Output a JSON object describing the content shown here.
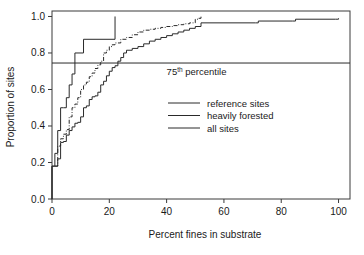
{
  "chart_data": {
    "type": "line",
    "title": "",
    "xlabel": "Percent fines in substrate",
    "ylabel": "Proportion of sites",
    "xlim": [
      0,
      104
    ],
    "ylim": [
      0,
      1.03
    ],
    "xticks": [
      0,
      20,
      40,
      60,
      80,
      100
    ],
    "xtick_labels": [
      "0",
      "20",
      "40",
      "60",
      "80",
      "100"
    ],
    "yticks": [
      0.0,
      0.2,
      0.4,
      0.6,
      0.8,
      1.0
    ],
    "ytick_labels": [
      "0.0",
      "0.2",
      "0.4",
      "0.6",
      "0.8",
      "1.0"
    ],
    "grid": false,
    "legend_position": "center",
    "annotations": [
      {
        "name": "percentile-reference-line",
        "text": "75",
        "superscript": "th",
        "text_tail": " percentile",
        "type": "horizontal-line",
        "y_value": 0.745,
        "x_start": 0,
        "x_end": 104,
        "label_x": 40,
        "label_y": 0.68
      }
    ],
    "series": [
      {
        "name": "reference sites",
        "style": "solid",
        "step": "post",
        "x": [
          0,
          0,
          1,
          1,
          2,
          2,
          3,
          3,
          4,
          5,
          6,
          7,
          8,
          11,
          22,
          22
        ],
        "y": [
          0.0,
          0.18,
          0.18,
          0.25,
          0.25,
          0.375,
          0.375,
          0.5,
          0.5,
          0.555,
          0.625,
          0.685,
          0.8,
          0.875,
          0.875,
          1.0
        ]
      },
      {
        "name": "heavily forested",
        "style": "dash-dot",
        "step": "post",
        "x": [
          1,
          2,
          3,
          4,
          5,
          6,
          7,
          8,
          9,
          10,
          11,
          12,
          13,
          14,
          15,
          16,
          17,
          18,
          19,
          20,
          21,
          22,
          24,
          26,
          28,
          30,
          32,
          34,
          36,
          38,
          40,
          42,
          44,
          46,
          48,
          50,
          51,
          52
        ],
        "y": [
          0.18,
          0.29,
          0.33,
          0.355,
          0.38,
          0.45,
          0.5,
          0.52,
          0.555,
          0.6,
          0.625,
          0.64,
          0.67,
          0.69,
          0.715,
          0.735,
          0.755,
          0.8,
          0.815,
          0.835,
          0.845,
          0.855,
          0.875,
          0.885,
          0.9,
          0.915,
          0.925,
          0.93,
          0.935,
          0.94,
          0.945,
          0.95,
          0.955,
          0.96,
          0.965,
          0.985,
          0.99,
          1.0
        ]
      },
      {
        "name": "all sites",
        "style": "solid",
        "step": "post",
        "x": [
          0,
          0,
          1,
          2,
          3,
          4,
          5,
          6,
          7,
          8,
          9,
          10,
          11,
          12,
          13,
          14,
          15,
          16,
          17,
          18,
          19,
          20,
          21,
          22,
          23,
          24,
          25,
          26,
          28,
          30,
          32,
          34,
          36,
          38,
          40,
          42,
          44,
          46,
          48,
          50,
          52,
          71,
          72,
          84,
          85,
          99,
          100
        ],
        "y": [
          0.0,
          0.18,
          0.18,
          0.22,
          0.31,
          0.315,
          0.35,
          0.375,
          0.395,
          0.415,
          0.42,
          0.45,
          0.5,
          0.51,
          0.545,
          0.56,
          0.565,
          0.585,
          0.625,
          0.645,
          0.675,
          0.7,
          0.72,
          0.73,
          0.755,
          0.775,
          0.8,
          0.815,
          0.825,
          0.835,
          0.85,
          0.865,
          0.875,
          0.885,
          0.895,
          0.905,
          0.915,
          0.925,
          0.935,
          0.945,
          0.965,
          0.965,
          0.975,
          0.975,
          0.985,
          0.985,
          0.99
        ]
      }
    ],
    "legend": [
      {
        "label": "reference sites",
        "style": "solid"
      },
      {
        "label": "heavily forested",
        "style": "dash-dot"
      },
      {
        "label": "all sites",
        "style": "solid"
      }
    ]
  }
}
